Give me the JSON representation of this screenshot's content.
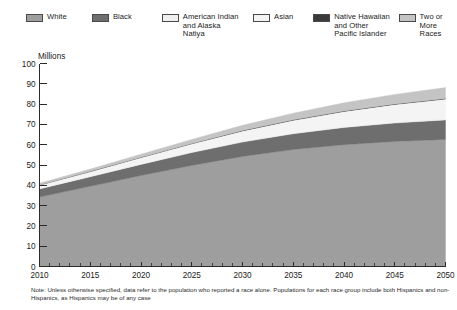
{
  "legend": {
    "items": [
      {
        "label": "White",
        "color": "#9e9e9e",
        "key": "white"
      },
      {
        "label": "Black",
        "color": "#6e6e6e",
        "key": "black"
      },
      {
        "label": "American Indian\nand Alaska\nNatiya",
        "color": "#efefef",
        "key": "american-indian-alaska-native"
      },
      {
        "label": "Asian",
        "color": "#f4f4f4",
        "key": "asian"
      },
      {
        "label": "Native Hawaiian\nand Other\nPacific Islander",
        "color": "#3a3a3a",
        "key": "native-hawaiian-pacific-islander"
      },
      {
        "label": "Two or\nMore\nRaces",
        "color": "#c4c4c4",
        "key": "two-or-more-races"
      }
    ]
  },
  "axes": {
    "y_unit_label": "Millions",
    "y_ticks": [
      "100",
      "90",
      "80",
      "70",
      "60",
      "50",
      "40",
      "30",
      "20",
      "10",
      "0"
    ],
    "x_ticks": [
      "2010",
      "2015",
      "2020",
      "2025",
      "2030",
      "2035",
      "2040",
      "2045",
      "2050"
    ]
  },
  "footnote": {
    "text": "Note: Unless otherwise specified, data refer to the population who reported a race alone. Populations for each race group include both Hispanics and non-Hispanics, as Hispanics may be of any case"
  },
  "chart_data": {
    "type": "area",
    "title": "",
    "xlabel": "",
    "ylabel": "Millions",
    "stacked": true,
    "grid": false,
    "legend_position": "top",
    "xlim": [
      2010,
      2050
    ],
    "ylim": [
      0,
      100
    ],
    "y_tick_step": 10,
    "x_tick_step": 5,
    "x_minor_tick_step": 1,
    "x": [
      2010,
      2015,
      2020,
      2025,
      2030,
      2035,
      2040,
      2045,
      2050
    ],
    "series": [
      {
        "name": "White",
        "color": "#9e9e9e",
        "values": [
          34.2,
          39.5,
          44.8,
          49.8,
          54.2,
          57.6,
          60.0,
          61.6,
          62.6
        ]
      },
      {
        "name": "Black",
        "color": "#6e6e6e",
        "values": [
          4.0,
          4.7,
          5.5,
          6.3,
          7.1,
          7.8,
          8.5,
          9.1,
          9.6
        ]
      },
      {
        "name": "American Indian and Alaska Natiya",
        "color": "#efefef",
        "values": [
          0.3,
          0.35,
          0.4,
          0.45,
          0.5,
          0.55,
          0.6,
          0.65,
          0.7
        ]
      },
      {
        "name": "Asian",
        "color": "#f4f4f4",
        "values": [
          1.6,
          2.2,
          3.0,
          3.9,
          5.0,
          6.1,
          7.3,
          8.5,
          9.6
        ]
      },
      {
        "name": "Native Hawaiian and Other Pacific Islander",
        "color": "#3a3a3a",
        "values": [
          0.1,
          0.12,
          0.14,
          0.16,
          0.18,
          0.2,
          0.22,
          0.24,
          0.26
        ]
      },
      {
        "name": "Two or More Races",
        "color": "#c4c4c4",
        "values": [
          0.8,
          1.1,
          1.5,
          2.0,
          2.6,
          3.3,
          4.0,
          4.7,
          5.4
        ]
      }
    ],
    "totals": [
      41.0,
      48.0,
      55.3,
      62.6,
      69.6,
      75.6,
      80.6,
      84.8,
      88.2
    ]
  }
}
